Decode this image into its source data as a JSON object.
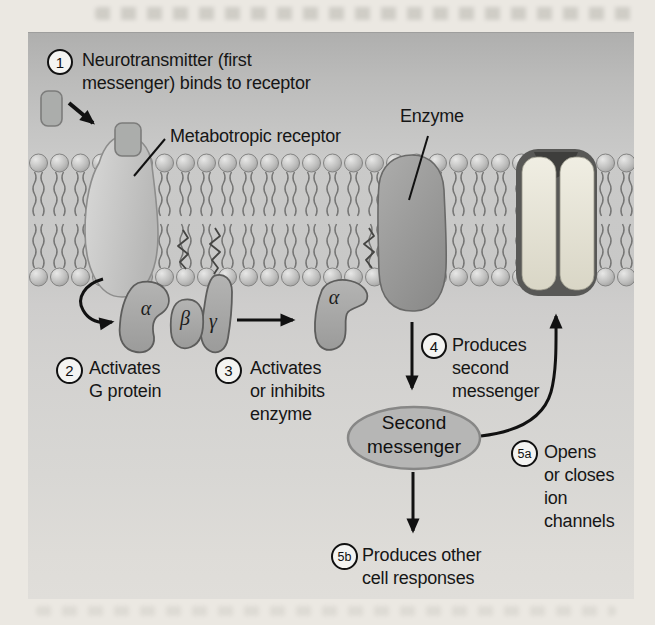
{
  "diagram": {
    "figure_subject": "Metabotropic receptor / G protein second-messenger signaling",
    "labels": {
      "metabotropic_receptor": "Metabotropic receptor",
      "enzyme": "Enzyme",
      "second_messenger": "Second\nmessenger"
    },
    "steps": [
      {
        "badge": "1",
        "text": "Neurotransmitter (first\nmessenger) binds to receptor"
      },
      {
        "badge": "2",
        "text": "Activates\nG protein"
      },
      {
        "badge": "3",
        "text": "Activates\nor inhibits\nenzyme"
      },
      {
        "badge": "4",
        "text": "Produces\nsecond\nmessenger"
      },
      {
        "badge": "5a",
        "text": "Opens\nor closes\nion\nchannels"
      },
      {
        "badge": "5b",
        "text": "Produces other\ncell responses"
      }
    ],
    "g_protein_subunits": {
      "alpha": "α",
      "beta": "β",
      "gamma": "γ",
      "alpha_activated": "α"
    },
    "colors": {
      "page_background": "#ebe8e2",
      "panel_top": "#afafae",
      "panel_bottom": "#e0deda",
      "lipid_head": "#c6c6c6",
      "lipid_tail": "#767676",
      "receptor_fill": "#c9c9c9",
      "neurotransmitter_fill": "#abadab",
      "enzyme_fill": "#9c9c9c",
      "ion_channel_rim": "#585858",
      "ion_channel_pore": "#e9e6da",
      "g_protein_fill": "#a8a8a8",
      "second_messenger_fill": "#b6b6b6",
      "ink": "#111111"
    }
  }
}
